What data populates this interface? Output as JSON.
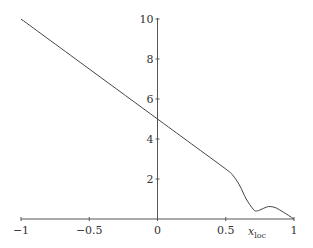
{
  "chart_data": {
    "type": "line",
    "title": "",
    "xlabel": "x_loc",
    "xlabel_main": "x",
    "xlabel_sub": "loc",
    "ylabel": "",
    "xlim": [
      -1,
      1
    ],
    "ylim": [
      0,
      10
    ],
    "grid": false,
    "legend": null,
    "x_ticks": [
      "−1",
      "−0.5",
      "0",
      "0.5",
      "1"
    ],
    "y_ticks": [
      "2",
      "4",
      "6",
      "8",
      "10"
    ],
    "series": [
      {
        "name": "curve",
        "x": [
          -1,
          -0.5,
          0,
          0.25,
          0.5,
          0.55,
          0.6,
          0.65,
          0.7,
          0.72,
          0.75,
          0.8,
          0.83,
          0.87,
          0.92,
          0.96,
          1.0
        ],
        "y": [
          10,
          7.5,
          5,
          3.75,
          2.5,
          2.2,
          1.7,
          1.0,
          0.5,
          0.4,
          0.45,
          0.6,
          0.62,
          0.55,
          0.35,
          0.18,
          0
        ]
      }
    ]
  },
  "colors": {
    "axis": "#555555",
    "line": "#444444",
    "text": "#333333"
  }
}
